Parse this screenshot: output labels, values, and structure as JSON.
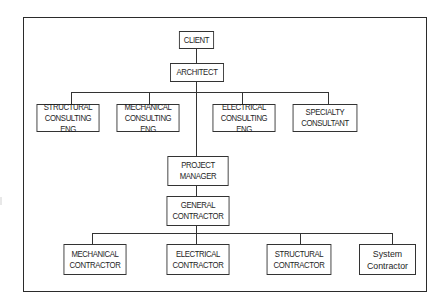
{
  "diagram": {
    "type": "organization-chart",
    "nodes": {
      "client": {
        "label": "CLIENT"
      },
      "architect": {
        "label": "ARCHITECT"
      },
      "structural_consulting": {
        "line1": "STRUCTURAL",
        "line2": "CONSULTING ENG"
      },
      "mechanical_consulting": {
        "line1": "MECHANICAL",
        "line2": "CONSULTING ENG"
      },
      "electrical_consulting": {
        "line1": "ELECTRICAL",
        "line2": "CONSULTING ENG"
      },
      "specialty_consultant": {
        "line1": "SPECIALTY",
        "line2": "CONSULTANT"
      },
      "project_manager": {
        "line1": "PROJECT",
        "line2": "MANAGER"
      },
      "general_contractor": {
        "line1": "GENERAL",
        "line2": "CONTRACTOR"
      },
      "mechanical_contractor": {
        "line1": "MECHANICAL",
        "line2": "CONTRACTOR"
      },
      "electrical_contractor": {
        "line1": "ELECTRICAL",
        "line2": "CONTRACTOR"
      },
      "structural_contractor": {
        "line1": "STRUCTURAL",
        "line2": "CONTRACTOR"
      },
      "system_contractor": {
        "line1": "System",
        "line2": "Contractor"
      }
    },
    "edges": [
      [
        "CLIENT",
        "ARCHITECT"
      ],
      [
        "ARCHITECT",
        "STRUCTURAL CONSULTING ENG"
      ],
      [
        "ARCHITECT",
        "MECHANICAL CONSULTING ENG"
      ],
      [
        "ARCHITECT",
        "ELECTRICAL CONSULTING ENG"
      ],
      [
        "ARCHITECT",
        "SPECIALTY CONSULTANT"
      ],
      [
        "ARCHITECT",
        "PROJECT MANAGER"
      ],
      [
        "PROJECT MANAGER",
        "GENERAL CONTRACTOR"
      ],
      [
        "GENERAL CONTRACTOR",
        "MECHANICAL CONTRACTOR"
      ],
      [
        "GENERAL CONTRACTOR",
        "ELECTRICAL CONTRACTOR"
      ],
      [
        "GENERAL CONTRACTOR",
        "STRUCTURAL CONTRACTOR"
      ],
      [
        "GENERAL CONTRACTOR",
        "System Contractor"
      ]
    ]
  }
}
